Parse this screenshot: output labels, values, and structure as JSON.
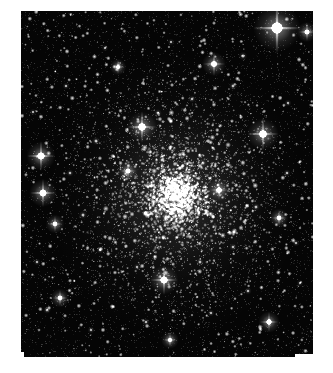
{
  "figure": {
    "kind": "astronomical-image",
    "caption": "",
    "background_color": "#ffffff",
    "sky_color": "#050505",
    "star_color": "#ffffff"
  },
  "frame": {
    "canvas_width": 333,
    "canvas_height": 373,
    "plate_left": 21,
    "plate_top": 11,
    "plate_width": 292,
    "plate_height": 346,
    "margin_color": "#ffffff"
  },
  "cluster": {
    "label": "globular cluster",
    "center_x": 176,
    "center_y": 196,
    "core_radius": 26,
    "halo_radius": 96,
    "member_star_count": 2600,
    "core_brightness": 1.0
  },
  "background_field": {
    "label": "field stars",
    "field_star_count": 1500,
    "noise_grain_count": 5200
  },
  "bright_stars": [
    {
      "name": "bright-star-upper-right",
      "x": 277,
      "y": 28,
      "radius": 7.5,
      "spike_length": 26,
      "magnitude_rank": 1
    },
    {
      "name": "bright-star-right-upper",
      "x": 263,
      "y": 134,
      "radius": 5.0,
      "spike_length": 17,
      "magnitude_rank": 2
    },
    {
      "name": "bright-star-left-upper",
      "x": 41,
      "y": 156,
      "radius": 4.6,
      "spike_length": 15,
      "magnitude_rank": 3
    },
    {
      "name": "bright-star-left-lower",
      "x": 43,
      "y": 193,
      "radius": 4.4,
      "spike_length": 14,
      "magnitude_rank": 4
    },
    {
      "name": "bright-star-above-cluster",
      "x": 142,
      "y": 127,
      "radius": 4.8,
      "spike_length": 16,
      "magnitude_rank": 5
    },
    {
      "name": "bright-star-below-cluster",
      "x": 164,
      "y": 280,
      "radius": 4.6,
      "spike_length": 15,
      "magnitude_rank": 6
    },
    {
      "name": "bright-star-upper-mid",
      "x": 214,
      "y": 64,
      "radius": 3.8,
      "spike_length": 12,
      "magnitude_rank": 7
    },
    {
      "name": "bright-star-far-right",
      "x": 307,
      "y": 32,
      "radius": 3.2,
      "spike_length": 9,
      "magnitude_rank": 8
    },
    {
      "name": "bright-star-lower-right",
      "x": 269,
      "y": 322,
      "radius": 3.4,
      "spike_length": 10,
      "magnitude_rank": 9
    },
    {
      "name": "bright-star-lower-left",
      "x": 60,
      "y": 298,
      "radius": 3.0,
      "spike_length": 8,
      "magnitude_rank": 10
    },
    {
      "name": "bright-star-cluster-east",
      "x": 219,
      "y": 190,
      "radius": 3.6,
      "spike_length": 10,
      "magnitude_rank": 11
    },
    {
      "name": "bright-star-cluster-west",
      "x": 128,
      "y": 171,
      "radius": 3.2,
      "spike_length": 9,
      "magnitude_rank": 12
    },
    {
      "name": "bright-star-mid-left",
      "x": 55,
      "y": 224,
      "radius": 3.0,
      "spike_length": 8,
      "magnitude_rank": 13
    },
    {
      "name": "bright-star-right-mid",
      "x": 279,
      "y": 218,
      "radius": 3.0,
      "spike_length": 8,
      "magnitude_rank": 14
    },
    {
      "name": "bright-star-bottom-mid",
      "x": 170,
      "y": 340,
      "radius": 2.8,
      "spike_length": 7,
      "magnitude_rank": 15
    },
    {
      "name": "bright-star-top-left",
      "x": 118,
      "y": 67,
      "radius": 2.6,
      "spike_length": 7,
      "magnitude_rank": 16
    }
  ],
  "medium_stars": [
    {
      "x": 243,
      "y": 56,
      "radius": 2.1
    },
    {
      "x": 233,
      "y": 86,
      "radius": 1.9
    },
    {
      "x": 192,
      "y": 99,
      "radius": 1.8
    },
    {
      "x": 158,
      "y": 113,
      "radius": 1.9
    },
    {
      "x": 96,
      "y": 141,
      "radius": 2.0
    },
    {
      "x": 70,
      "y": 173,
      "radius": 1.8
    },
    {
      "x": 83,
      "y": 215,
      "radius": 2.0
    },
    {
      "x": 100,
      "y": 250,
      "radius": 1.8
    },
    {
      "x": 137,
      "y": 267,
      "radius": 1.7
    },
    {
      "x": 200,
      "y": 262,
      "radius": 1.9
    },
    {
      "x": 233,
      "y": 247,
      "radius": 1.8
    },
    {
      "x": 256,
      "y": 207,
      "radius": 1.9
    },
    {
      "x": 287,
      "y": 173,
      "radius": 1.8
    },
    {
      "x": 296,
      "y": 243,
      "radius": 1.7
    },
    {
      "x": 248,
      "y": 291,
      "radius": 1.8
    },
    {
      "x": 211,
      "y": 313,
      "radius": 1.7
    },
    {
      "x": 146,
      "y": 322,
      "radius": 1.8
    },
    {
      "x": 91,
      "y": 330,
      "radius": 1.7
    },
    {
      "x": 47,
      "y": 310,
      "radius": 1.9
    },
    {
      "x": 37,
      "y": 262,
      "radius": 1.7
    },
    {
      "x": 33,
      "y": 112,
      "radius": 1.6
    },
    {
      "x": 66,
      "y": 86,
      "radius": 1.7
    },
    {
      "x": 105,
      "y": 48,
      "radius": 1.6
    },
    {
      "x": 171,
      "y": 42,
      "radius": 1.6
    },
    {
      "x": 288,
      "y": 103,
      "radius": 1.7
    },
    {
      "x": 300,
      "y": 283,
      "radius": 1.6
    },
    {
      "x": 182,
      "y": 229,
      "radius": 2.2
    },
    {
      "x": 151,
      "y": 213,
      "radius": 2.0
    },
    {
      "x": 203,
      "y": 163,
      "radius": 2.0
    },
    {
      "x": 162,
      "y": 160,
      "radius": 1.9
    }
  ],
  "render_params": {
    "random_seed": 20240617,
    "core_concentration": 2.4,
    "halo_falloff": 1.8
  }
}
